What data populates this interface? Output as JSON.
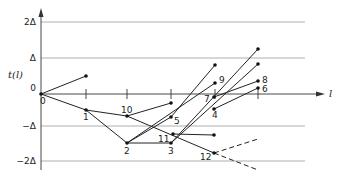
{
  "diagram": {
    "title": "",
    "y_axis_label": "t(l)",
    "x_axis_label": "l",
    "y_ticks": [
      {
        "label": "2Δ",
        "y": 22
      },
      {
        "label": "Δ",
        "y": 58
      },
      {
        "label": "0",
        "y": 94
      },
      {
        "label": "−Δ",
        "y": 126
      },
      {
        "label": "−2Δ",
        "y": 161
      }
    ],
    "x_ticks": [
      86,
      127,
      171,
      219,
      258
    ],
    "node_labels": [
      {
        "label": "0",
        "x": 41,
        "y": 94
      },
      {
        "label": "1",
        "x": 86,
        "y": 110
      },
      {
        "label": "2",
        "x": 127,
        "y": 143
      },
      {
        "label": "3",
        "x": 171,
        "y": 143
      },
      {
        "label": "4",
        "x": 214,
        "y": 109
      },
      {
        "label": "5",
        "x": 171,
        "y": 117
      },
      {
        "label": "6",
        "x": 258,
        "y": 88
      },
      {
        "label": "7",
        "x": 214,
        "y": 97
      },
      {
        "label": "8",
        "x": 258,
        "y": 81
      },
      {
        "label": "9",
        "x": 215,
        "y": 83
      },
      {
        "label": "10",
        "x": 127,
        "y": 116
      },
      {
        "label": "11",
        "x": 173,
        "y": 136
      },
      {
        "label": "12",
        "x": 214,
        "y": 153
      }
    ]
  }
}
